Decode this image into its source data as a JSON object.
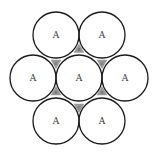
{
  "diagram": {
    "type": "hexagonal close packing of circles",
    "stroke_color": "#1a1a1a",
    "interstice_fill": "#9a9a9a",
    "radius": 23,
    "circles": [
      {
        "id": "top-left",
        "cx": 56,
        "cy": 35,
        "label": "A"
      },
      {
        "id": "top-right",
        "cx": 102,
        "cy": 35,
        "label": "A"
      },
      {
        "id": "middle-left",
        "cx": 33,
        "cy": 78,
        "label": "A"
      },
      {
        "id": "center",
        "cx": 79,
        "cy": 78,
        "label": "A"
      },
      {
        "id": "middle-right",
        "cx": 125,
        "cy": 78,
        "label": "A"
      },
      {
        "id": "bottom-left",
        "cx": 56,
        "cy": 121,
        "label": "A"
      },
      {
        "id": "bottom-right",
        "cx": 102,
        "cy": 121,
        "label": "A"
      }
    ],
    "interstices": [
      {
        "id": "top",
        "cx": 79,
        "cy": 49.5,
        "label": "B"
      },
      {
        "id": "upper-left",
        "cx": 56,
        "cy": 63,
        "label": "C"
      },
      {
        "id": "upper-right",
        "cx": 102,
        "cy": 63,
        "label": "C"
      },
      {
        "id": "lower-left",
        "cx": 56,
        "cy": 92,
        "label": "B"
      },
      {
        "id": "lower-right",
        "cx": 102,
        "cy": 92,
        "label": "B"
      },
      {
        "id": "bottom",
        "cx": 79,
        "cy": 107,
        "label": "C"
      }
    ]
  }
}
